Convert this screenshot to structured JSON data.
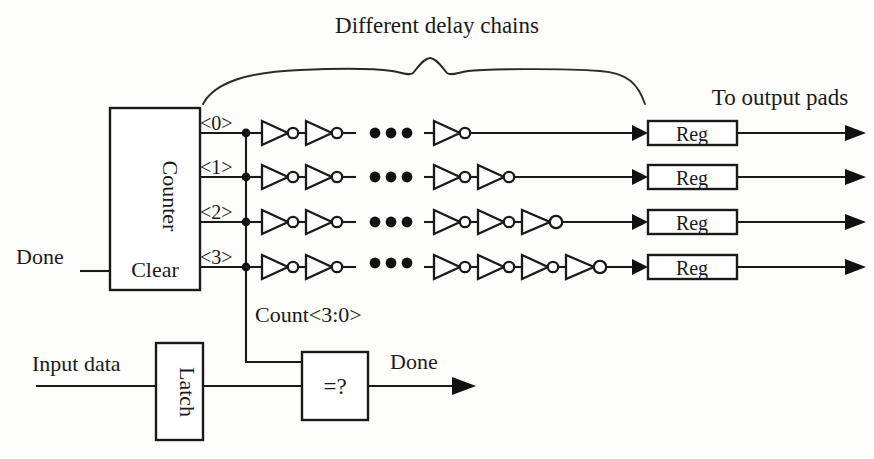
{
  "figure": {
    "title": "Different delay chains",
    "to_output_pads": "To output pads",
    "count_bus_label": "Count<3:0>",
    "done_input_label": "Done",
    "done_output_label": "Done",
    "input_data_label": "Input data",
    "ink_color": "#1a1a1a",
    "background_color": "#fdfdfb"
  },
  "blocks": {
    "counter": {
      "label": "Counter",
      "clear_label": "Clear"
    },
    "latch": {
      "label": "Latch"
    },
    "comparator": {
      "label": "=?"
    },
    "registers": [
      {
        "label": "Reg"
      },
      {
        "label": "Reg"
      },
      {
        "label": "Reg"
      },
      {
        "label": "Reg"
      }
    ]
  },
  "bus_taps": [
    {
      "name": "<0>",
      "label": "<0>",
      "row": 0
    },
    {
      "name": "<1>",
      "label": "<1>",
      "row": 1
    },
    {
      "name": "<2>",
      "label": "<2>",
      "row": 2
    },
    {
      "name": "<3>",
      "label": "<3>",
      "row": 3
    }
  ],
  "delay_chains": [
    {
      "tap": "<0>",
      "left_inverters": 2,
      "ellipsis": "...",
      "right_inverters": 1,
      "register": "Reg"
    },
    {
      "tap": "<1>",
      "left_inverters": 2,
      "ellipsis": "...",
      "right_inverters": 2,
      "register": "Reg"
    },
    {
      "tap": "<2>",
      "left_inverters": 2,
      "ellipsis": "...",
      "right_inverters": 3,
      "register": "Reg"
    },
    {
      "tap": "<3>",
      "left_inverters": 2,
      "ellipsis": "...",
      "right_inverters": 4,
      "register": "Reg"
    }
  ]
}
